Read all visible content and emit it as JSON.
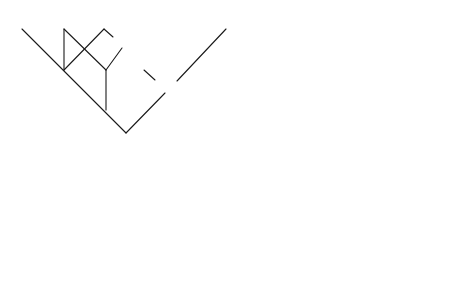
{
  "figure": {
    "panels": [
      {
        "id": "top-left",
        "type": "tree-with-links"
      },
      {
        "id": "top-right",
        "type": "hierarchical-tree"
      },
      {
        "id": "bottom-left",
        "type": "overlapping-boxes"
      },
      {
        "id": "bottom-right",
        "type": "nested-boxes"
      }
    ]
  },
  "top_left_tree": {
    "leaf_labels": [
      "M",
      "M",
      "3",
      "4",
      "5",
      "6"
    ],
    "internal_labels": [
      "34",
      "45",
      "345",
      "3456"
    ],
    "node_labels": [
      "M",
      "M",
      "M",
      "M"
    ],
    "link_labels": [
      "L",
      "L",
      "L",
      "L",
      "L",
      "L",
      "L",
      "L",
      "L",
      "L"
    ]
  },
  "top_right_tree": {
    "leaf_labels": [
      "1",
      "2",
      "3",
      "4",
      "5",
      "6"
    ],
    "internal_labels": [
      "12",
      "345",
      "3456",
      "123456"
    ]
  },
  "bottom_left_boxes": {
    "labels": [
      "1",
      "2",
      "3",
      "4",
      "5",
      "6"
    ]
  },
  "bottom_right_boxes": {
    "labels": [
      "1",
      "2",
      "3",
      "4",
      "5",
      "6"
    ]
  }
}
